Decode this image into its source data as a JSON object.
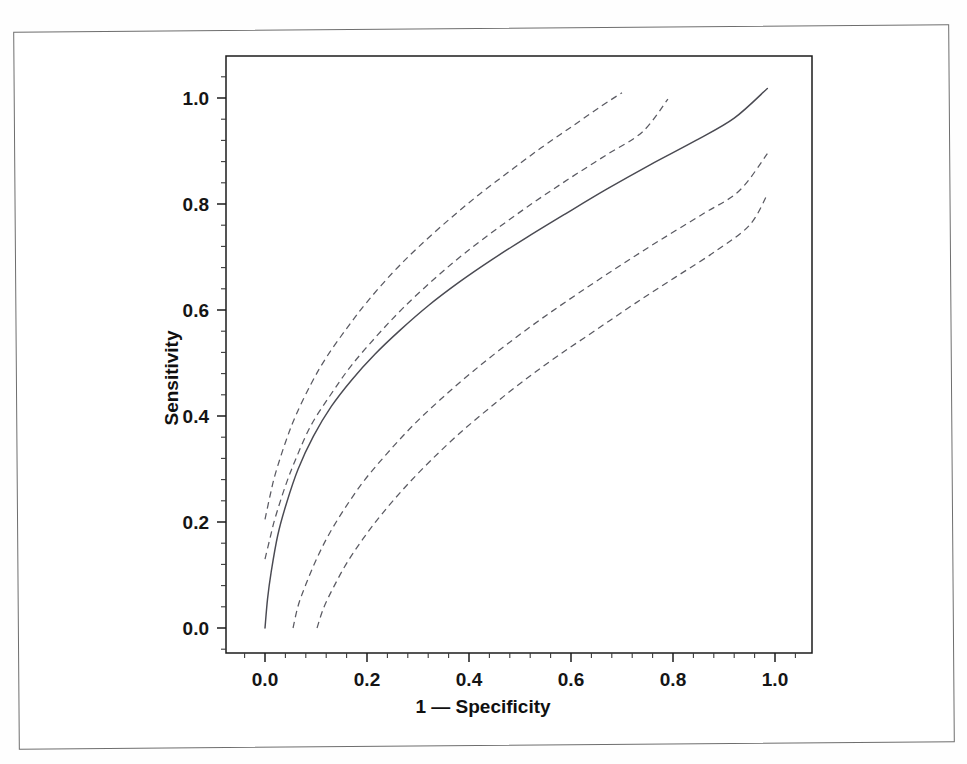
{
  "figure": {
    "kind": "roc-curve-plot",
    "background_color": "#ffffff",
    "frame_color": "#6e6e6e",
    "plot_border_color": "#1c1c1c"
  },
  "axes": {
    "x_title": "1 — Specificity",
    "y_title": "Sensitivity",
    "x_ticks": [
      "0.0",
      "0.2",
      "0.4",
      "0.6",
      "0.8",
      "1.0"
    ],
    "y_ticks": [
      "0.0",
      "0.2",
      "0.4",
      "0.6",
      "0.8",
      "1.0"
    ]
  },
  "chart_data": {
    "type": "line",
    "title": "",
    "subtitle": "",
    "xlabel": "1 — Specificity",
    "ylabel": "Sensitivity",
    "xlim": [
      -0.09,
      1.1
    ],
    "ylim": [
      -0.07,
      1.1
    ],
    "xticks": [
      0.0,
      0.2,
      0.4,
      0.6,
      0.8,
      1.0
    ],
    "yticks": [
      0.0,
      0.2,
      0.4,
      0.6,
      0.8,
      1.0
    ],
    "xtick_labels": [
      "0.0",
      "0.2",
      "0.4",
      "0.6",
      "0.8",
      "1.0"
    ],
    "ytick_labels": [
      "0.0",
      "0.2",
      "0.4",
      "0.6",
      "0.8",
      "1.0"
    ],
    "minor_ticks_per_interval": 4,
    "grid": false,
    "legend": "none",
    "annotations": [],
    "series": [
      {
        "name": "Upper outer confidence band",
        "style": "dashed",
        "color": "#5a5a62",
        "x": [
          0.0,
          0.01,
          0.02,
          0.04,
          0.06,
          0.09,
          0.12,
          0.16,
          0.2,
          0.25,
          0.3,
          0.36,
          0.42,
          0.48,
          0.54,
          0.6,
          0.66,
          0.7
        ],
        "y": [
          0.205,
          0.25,
          0.29,
          0.35,
          0.4,
          0.46,
          0.51,
          0.565,
          0.615,
          0.67,
          0.718,
          0.77,
          0.818,
          0.862,
          0.905,
          0.945,
          0.985,
          1.01
        ]
      },
      {
        "name": "Upper inner confidence band",
        "style": "dashed",
        "color": "#5a5a62",
        "x": [
          0.0,
          0.01,
          0.02,
          0.04,
          0.06,
          0.09,
          0.13,
          0.17,
          0.22,
          0.27,
          0.33,
          0.39,
          0.46,
          0.53,
          0.6,
          0.67,
          0.74,
          0.79
        ],
        "y": [
          0.13,
          0.17,
          0.208,
          0.268,
          0.318,
          0.382,
          0.442,
          0.496,
          0.552,
          0.603,
          0.657,
          0.706,
          0.757,
          0.805,
          0.85,
          0.893,
          0.936,
          0.998
        ]
      },
      {
        "name": "ROC curve (point estimate)",
        "style": "solid",
        "color": "#4a4a52",
        "x": [
          0.0,
          0.005,
          0.012,
          0.025,
          0.042,
          0.065,
          0.095,
          0.13,
          0.17,
          0.215,
          0.265,
          0.32,
          0.38,
          0.445,
          0.515,
          0.59,
          0.67,
          0.755,
          0.845,
          0.92,
          0.985
        ],
        "y": [
          0.0,
          0.055,
          0.105,
          0.175,
          0.235,
          0.3,
          0.362,
          0.418,
          0.468,
          0.516,
          0.562,
          0.608,
          0.652,
          0.695,
          0.738,
          0.782,
          0.828,
          0.874,
          0.92,
          0.962,
          1.018
        ]
      },
      {
        "name": "Lower inner confidence band",
        "style": "dashed",
        "color": "#5a5a62",
        "x": [
          0.055,
          0.065,
          0.08,
          0.1,
          0.125,
          0.158,
          0.196,
          0.24,
          0.29,
          0.345,
          0.405,
          0.47,
          0.54,
          0.615,
          0.695,
          0.775,
          0.86,
          0.93,
          0.985
        ],
        "y": [
          0.0,
          0.042,
          0.082,
          0.128,
          0.176,
          0.228,
          0.28,
          0.33,
          0.382,
          0.432,
          0.482,
          0.532,
          0.582,
          0.632,
          0.683,
          0.732,
          0.782,
          0.825,
          0.895
        ]
      },
      {
        "name": "Lower outer confidence band",
        "style": "dashed",
        "color": "#5a5a62",
        "x": [
          0.102,
          0.115,
          0.135,
          0.16,
          0.192,
          0.23,
          0.275,
          0.325,
          0.38,
          0.44,
          0.505,
          0.575,
          0.65,
          0.725,
          0.805,
          0.885,
          0.95,
          0.985
        ],
        "y": [
          0.0,
          0.038,
          0.078,
          0.122,
          0.168,
          0.216,
          0.266,
          0.316,
          0.366,
          0.415,
          0.465,
          0.514,
          0.563,
          0.612,
          0.662,
          0.712,
          0.76,
          0.818
        ]
      }
    ]
  }
}
